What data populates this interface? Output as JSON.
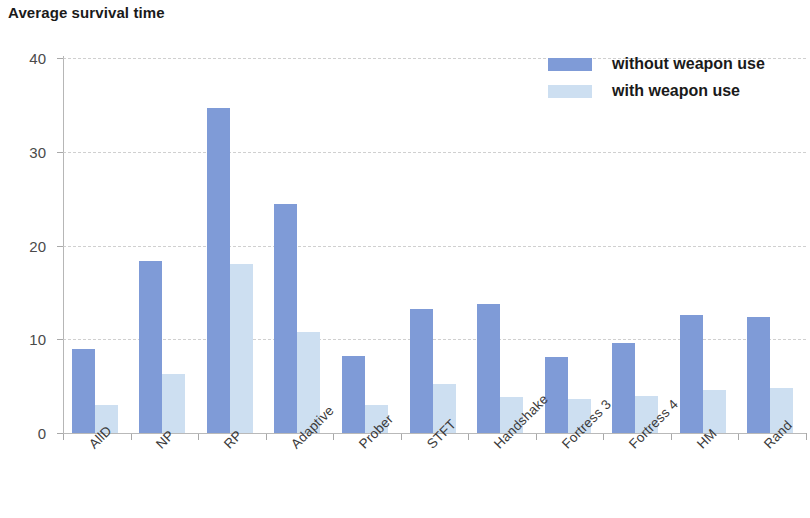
{
  "chart_data": {
    "type": "bar",
    "title": "Average survival time",
    "xlabel": "",
    "ylabel": "",
    "ylim": [
      0,
      40
    ],
    "yticks": [
      0,
      10,
      20,
      30,
      40
    ],
    "grid": true,
    "legend_position": "top-right",
    "categories": [
      "AllD",
      "NP",
      "RP",
      "Adaptive",
      "Prober",
      "STFT",
      "Handshake",
      "Fortress 3",
      "Fortress 4",
      "HM",
      "Rand"
    ],
    "series": [
      {
        "name": "without weapon use",
        "color": "#7f9bd7",
        "values": [
          9.0,
          18.4,
          34.7,
          24.4,
          8.2,
          13.2,
          13.8,
          8.1,
          9.6,
          12.6,
          12.4
        ]
      },
      {
        "name": "with weapon use",
        "color": "#cddff1",
        "values": [
          3.0,
          6.3,
          18.0,
          10.8,
          3.0,
          5.2,
          3.8,
          3.6,
          4.0,
          4.6,
          4.8
        ]
      }
    ]
  }
}
